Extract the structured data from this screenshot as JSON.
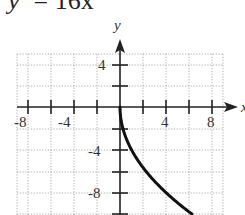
{
  "title": {
    "lhs": "y",
    "sup": "2",
    "rhs": " = 16x"
  },
  "axes": {
    "x_label": "x",
    "y_label": "y"
  },
  "chart_data": {
    "type": "line",
    "xlabel": "x",
    "ylabel": "y",
    "xlim": [
      -9,
      9
    ],
    "ylim": [
      -10,
      5
    ],
    "grid": true,
    "grid_spacing": 2,
    "x_tick_labels": [
      "-8",
      "-4",
      "4",
      "8"
    ],
    "y_tick_labels": [
      "4",
      "-4",
      "-8"
    ],
    "series": [
      {
        "name": "y = -4√x",
        "x": [
          0,
          0.25,
          1,
          2,
          3,
          4,
          5,
          6.25
        ],
        "y": [
          0,
          -2,
          -4,
          -5.66,
          -6.93,
          -8,
          -8.94,
          -10
        ]
      }
    ]
  }
}
